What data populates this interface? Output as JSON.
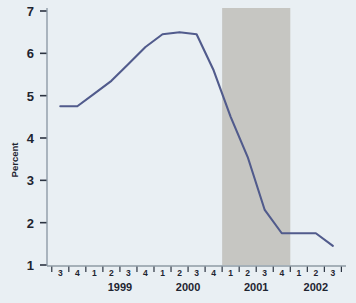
{
  "chart_data": {
    "type": "line",
    "title": "",
    "xlabel": "",
    "ylabel": "Percent",
    "ylim": [
      1,
      7
    ],
    "y_ticks": [
      1,
      2,
      3,
      4,
      5,
      6,
      7
    ],
    "grid": false,
    "legend": null,
    "line_color": "#515b8c",
    "background_color": "#e9eff3",
    "shaded_band": {
      "label": "",
      "color": "#c6c6c2",
      "x_start": "2001 Q1",
      "x_end": "2001 Q4"
    },
    "categories": [
      "1998 Q3",
      "1998 Q4",
      "1999 Q1",
      "1999 Q2",
      "1999 Q3",
      "1999 Q4",
      "2000 Q1",
      "2000 Q2",
      "2000 Q3",
      "2000 Q4",
      "2001 Q1",
      "2001 Q2",
      "2001 Q3",
      "2001 Q4",
      "2002 Q1",
      "2002 Q2",
      "2002 Q3"
    ],
    "quarter_labels": [
      "3",
      "4",
      "1",
      "2",
      "3",
      "4",
      "1",
      "2",
      "3",
      "4",
      "1",
      "2",
      "3",
      "4",
      "1",
      "2",
      "3"
    ],
    "year_labels": [
      "1999",
      "2000",
      "2001",
      "2002"
    ],
    "values": [
      4.75,
      4.75,
      5.05,
      5.35,
      5.75,
      6.15,
      6.45,
      6.5,
      6.45,
      5.6,
      4.5,
      3.55,
      2.3,
      1.75,
      1.75,
      1.75,
      1.45
    ]
  }
}
